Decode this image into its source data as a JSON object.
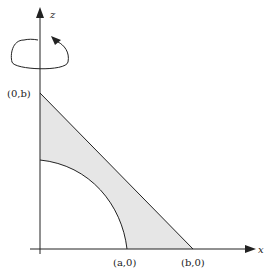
{
  "diagram": {
    "axes": {
      "vertical_label": "z",
      "horizontal_label": "x"
    },
    "points": {
      "top": "(0,b)",
      "a": "(a,0)",
      "b": "(b,0)"
    },
    "rotation_indicator": "rotation-about-z-axis",
    "region_fill": "#e6e6e6",
    "line_color": "#222222"
  }
}
